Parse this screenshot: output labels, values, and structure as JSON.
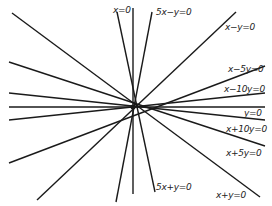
{
  "diagram": {
    "center": [
      133,
      107
    ],
    "line_color": "#1a1a1a",
    "lines": [
      {
        "label": "x=0",
        "x1": 133,
        "y1": 8,
        "x2": 133,
        "y2": 194
      },
      {
        "label": "5x-y=0",
        "x1": 152,
        "y1": 12,
        "x2": 116,
        "y2": 202
      },
      {
        "label": "5x+y=0",
        "x1": 117,
        "y1": 12,
        "x2": 155,
        "y2": 192
      },
      {
        "label": "x-y=0",
        "x1": 236,
        "y1": 12,
        "x2": 37,
        "y2": 200
      },
      {
        "label": "x-5y=0",
        "x1": 265,
        "y1": 66,
        "x2": 9,
        "y2": 163
      },
      {
        "label": "x-10y=0",
        "x1": 265,
        "y1": 93,
        "x2": 9,
        "y2": 120
      },
      {
        "label": "y=0",
        "x1": 265,
        "y1": 107,
        "x2": 9,
        "y2": 107
      },
      {
        "label": "x+10y=0",
        "x1": 265,
        "y1": 120,
        "x2": 9,
        "y2": 93
      },
      {
        "label": "x+5y=0",
        "x1": 265,
        "y1": 146,
        "x2": 9,
        "y2": 62
      },
      {
        "label": "x+y=0",
        "x1": 260,
        "y1": 197,
        "x2": 12,
        "y2": 13
      }
    ],
    "labels": [
      {
        "text": "x=0",
        "x": 113,
        "y": 5
      },
      {
        "text": "5x−y=0",
        "x": 156,
        "y": 7
      },
      {
        "text": "x−y=0",
        "x": 225,
        "y": 22
      },
      {
        "text": "x−5y=0",
        "x": 228,
        "y": 64
      },
      {
        "text": "x−10y=0",
        "x": 224,
        "y": 84
      },
      {
        "text": "y=0",
        "x": 244,
        "y": 108
      },
      {
        "text": "x+10y=0",
        "x": 226,
        "y": 124
      },
      {
        "text": "x+5y=0",
        "x": 226,
        "y": 148
      },
      {
        "text": "5x+y=0",
        "x": 156,
        "y": 182
      },
      {
        "text": "x+y=0",
        "x": 216,
        "y": 190
      }
    ]
  }
}
